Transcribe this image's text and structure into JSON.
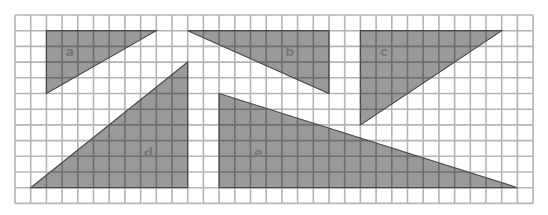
{
  "grid": {
    "origin_x": 15,
    "origin_y": 15,
    "cell": 15.7,
    "cols": 33,
    "rows": 12,
    "line_color": "#b4b4b4",
    "background": "#ffffff"
  },
  "style": {
    "fill_color": "#9a9a9a",
    "inner_line_color": "#6e6e6e",
    "edge_color": "#4a4a4a",
    "label_color": "#787878"
  },
  "triangles": [
    {
      "label": "a",
      "vertices": [
        [
          2,
          1
        ],
        [
          9,
          1
        ],
        [
          2,
          5
        ]
      ],
      "label_pos": [
        3.5,
        2.4
      ]
    },
    {
      "label": "b",
      "vertices": [
        [
          11,
          1
        ],
        [
          20,
          1
        ],
        [
          20,
          5
        ]
      ],
      "label_pos": [
        17.5,
        2.4
      ]
    },
    {
      "label": "c",
      "vertices": [
        [
          22,
          1
        ],
        [
          31,
          1
        ],
        [
          22,
          7
        ]
      ],
      "label_pos": [
        23.5,
        2.4
      ]
    },
    {
      "label": "d",
      "vertices": [
        [
          1,
          11
        ],
        [
          11,
          3
        ],
        [
          11,
          11
        ]
      ],
      "label_pos": [
        8.5,
        8.8
      ]
    },
    {
      "label": "e",
      "vertices": [
        [
          13,
          5
        ],
        [
          13,
          11
        ],
        [
          32,
          11
        ]
      ],
      "label_pos": [
        15.5,
        8.8
      ]
    }
  ]
}
